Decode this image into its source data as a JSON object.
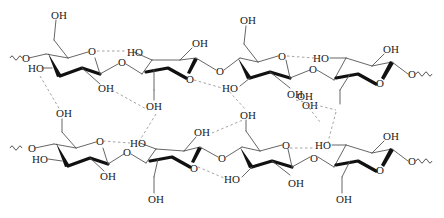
{
  "labels": {
    "oh": "OH",
    "ho": "HO",
    "o": "O"
  },
  "chains": [
    {
      "name": "top-chain",
      "units": [
        {
          "orientation": "up",
          "substituents": [
            "OH",
            "HO",
            "OH",
            "O"
          ]
        },
        {
          "orientation": "down",
          "substituents": [
            "HO",
            "OH",
            "O",
            "OH"
          ]
        },
        {
          "orientation": "up",
          "substituents": [
            "OH",
            "O",
            "HO",
            "OH"
          ]
        },
        {
          "orientation": "down",
          "substituents": [
            "HO",
            "OH",
            "O",
            "OH"
          ]
        }
      ],
      "glycosidic_linkages": [
        "O",
        "O",
        "O"
      ],
      "termini": [
        "O",
        "O"
      ]
    },
    {
      "name": "bottom-chain",
      "units": [
        {
          "orientation": "up",
          "substituents": [
            "OH",
            "HO",
            "OH",
            "O"
          ]
        },
        {
          "orientation": "down",
          "substituents": [
            "HO",
            "OH",
            "O",
            "OH"
          ]
        },
        {
          "orientation": "up",
          "substituents": [
            "OH",
            "O",
            "HO",
            "OH"
          ]
        },
        {
          "orientation": "down",
          "substituents": [
            "HO",
            "OH",
            "O",
            "OH"
          ]
        }
      ],
      "glycosidic_linkages": [
        "O",
        "O",
        "O"
      ],
      "termini": [
        "O",
        "O"
      ]
    }
  ],
  "bond_types": {
    "covalent": "solid",
    "hydrogen": "dashed"
  },
  "colors": {
    "bond": "#555555",
    "bold_bond": "#111111",
    "hydrogen_bond": "#999999",
    "text": "#222222"
  }
}
